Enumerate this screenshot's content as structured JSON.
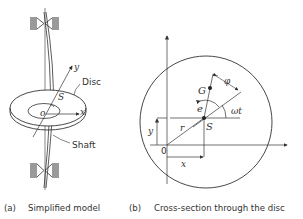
{
  "panel_a": {
    "caption_tag": "(a)",
    "caption": "Simplified model",
    "labels": {
      "disc": "Disc",
      "shaft": "Shaft",
      "y_axis": "y",
      "x_axis": "x",
      "origin": "o",
      "shaft_center": "S"
    }
  },
  "panel_b": {
    "caption_tag": "(b)",
    "caption": "Cross-section through the disc",
    "labels": {
      "centre_of_gravity": "G",
      "eccentricity": "e",
      "phase": "φ",
      "rotation_angle": "ωt",
      "radius": "r",
      "shaft_center": "S",
      "origin": "0",
      "x": "x",
      "y": "y"
    }
  },
  "colors": {
    "line": "#333333",
    "bearing": "#9a9a9a"
  }
}
